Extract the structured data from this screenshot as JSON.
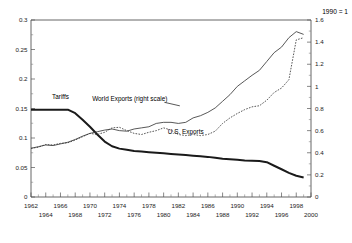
{
  "chart_data": {
    "type": "line",
    "title": "",
    "xlabel": "",
    "ylabel": "",
    "right_axis_note": "1990 = 1",
    "grid": false,
    "legend_position": "inline-annotations",
    "xlim": [
      1962,
      2000
    ],
    "left_ylim": [
      0,
      0.3
    ],
    "right_ylim": [
      0,
      1.6
    ],
    "left_ticks": [
      "0",
      "0.05",
      "0.1",
      "0.15",
      "0.2",
      "0.25",
      "0.3"
    ],
    "left_tick_values": [
      0,
      0.05,
      0.1,
      0.15,
      0.2,
      0.25,
      0.3
    ],
    "right_ticks": [
      "0",
      "0.2",
      "0.4",
      "0.6",
      "0.8",
      "1",
      "1.2",
      "1.4",
      "1.6"
    ],
    "right_tick_values": [
      0,
      0.2,
      0.4,
      0.6,
      0.8,
      1,
      1.2,
      1.4,
      1.6
    ],
    "x_ticks_upper": [
      1962,
      1966,
      1970,
      1974,
      1978,
      1982,
      1986,
      1990,
      1994,
      1998
    ],
    "x_ticks_lower": [
      1964,
      1968,
      1972,
      1976,
      1980,
      1984,
      1988,
      1992,
      1996,
      2000
    ],
    "x_ticks_upper_labels": [
      "1962",
      "1966",
      "1970",
      "1974",
      "1978",
      "1982",
      "1986",
      "1990",
      "1994",
      "1998"
    ],
    "x_ticks_lower_labels": [
      "1964",
      "1968",
      "1972",
      "1976",
      "1980",
      "1984",
      "1988",
      "1992",
      "1996",
      "2000"
    ],
    "annotations": [
      {
        "id": "tariffs",
        "text": "Tariffs",
        "x": 1966.0,
        "y_left": 0.166
      },
      {
        "id": "world-exports",
        "text": "World Exports (right scale)",
        "x": 1975.4,
        "y_left": 0.163
      },
      {
        "id": "us-exports",
        "text": "U.S. Exports",
        "x": 1983.0,
        "y_left": 0.106
      }
    ],
    "series": [
      {
        "name": "Tariffs",
        "axis": "left",
        "style": "solid-thick",
        "x": [
          1962,
          1963,
          1964,
          1965,
          1966,
          1967,
          1968,
          1969,
          1970,
          1971,
          1972,
          1973,
          1974,
          1975,
          1976,
          1977,
          1978,
          1979,
          1980,
          1981,
          1982,
          1983,
          1984,
          1985,
          1986,
          1987,
          1988,
          1989,
          1990,
          1991,
          1992,
          1993,
          1994,
          1995,
          1996,
          1997,
          1998,
          1999
        ],
        "values": [
          0.148,
          0.148,
          0.148,
          0.148,
          0.148,
          0.148,
          0.142,
          0.131,
          0.119,
          0.106,
          0.094,
          0.086,
          0.082,
          0.08,
          0.078,
          0.077,
          0.076,
          0.075,
          0.074,
          0.073,
          0.072,
          0.071,
          0.07,
          0.069,
          0.068,
          0.0665,
          0.065,
          0.064,
          0.063,
          0.062,
          0.0615,
          0.061,
          0.059,
          0.053,
          0.047,
          0.041,
          0.036,
          0.033
        ]
      },
      {
        "name": "World Exports (right scale)",
        "axis": "right",
        "style": "solid-thin",
        "x": [
          1962,
          1963,
          1964,
          1965,
          1966,
          1967,
          1968,
          1969,
          1970,
          1971,
          1972,
          1973,
          1974,
          1975,
          1976,
          1977,
          1978,
          1979,
          1980,
          1981,
          1982,
          1983,
          1984,
          1985,
          1986,
          1987,
          1988,
          1989,
          1990,
          1991,
          1992,
          1993,
          1994,
          1995,
          1996,
          1997,
          1998,
          1999
        ],
        "values": [
          0.44,
          0.455,
          0.47,
          0.465,
          0.48,
          0.495,
          0.52,
          0.55,
          0.575,
          0.59,
          0.605,
          0.615,
          0.6,
          0.595,
          0.615,
          0.625,
          0.635,
          0.665,
          0.675,
          0.675,
          0.665,
          0.675,
          0.715,
          0.735,
          0.765,
          0.805,
          0.865,
          0.925,
          1.0,
          1.05,
          1.1,
          1.145,
          1.225,
          1.305,
          1.355,
          1.44,
          1.495,
          1.47
        ]
      },
      {
        "name": "U.S. Exports",
        "axis": "right",
        "style": "dotted",
        "x": [
          1962,
          1963,
          1964,
          1965,
          1966,
          1967,
          1968,
          1969,
          1970,
          1971,
          1972,
          1973,
          1974,
          1975,
          1976,
          1977,
          1978,
          1979,
          1980,
          1981,
          1982,
          1983,
          1984,
          1985,
          1986,
          1987,
          1988,
          1989,
          1990,
          1991,
          1992,
          1993,
          1994,
          1995,
          1996,
          1997,
          1998,
          1999
        ],
        "values": [
          0.44,
          0.45,
          0.475,
          0.47,
          0.485,
          0.49,
          0.515,
          0.545,
          0.575,
          0.565,
          0.585,
          0.625,
          0.63,
          0.6,
          0.575,
          0.565,
          0.585,
          0.6,
          0.625,
          0.605,
          0.565,
          0.555,
          0.565,
          0.555,
          0.565,
          0.595,
          0.665,
          0.715,
          0.755,
          0.79,
          0.815,
          0.825,
          0.875,
          0.945,
          0.985,
          1.06,
          1.42,
          1.44
        ]
      }
    ]
  },
  "colors": {
    "ink": "#1a1a1a",
    "axis": "#555555",
    "background": "#ffffff"
  }
}
